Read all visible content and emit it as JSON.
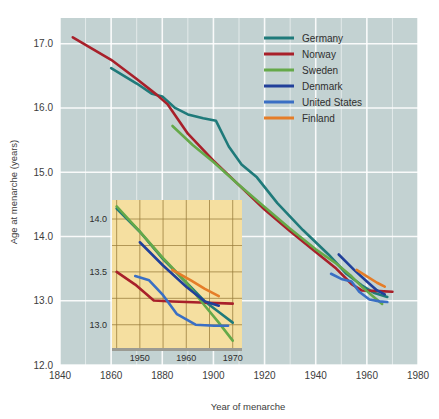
{
  "chart_data": {
    "type": "line",
    "title": "",
    "xlabel": "Year of menarche",
    "ylabel": "Age at menarche (years)",
    "xlim": [
      1840,
      1980
    ],
    "ylim": [
      12.0,
      17.4
    ],
    "xticks": [
      1840,
      1860,
      1880,
      1900,
      1920,
      1940,
      1960,
      1980
    ],
    "yticks": [
      12.0,
      13.0,
      14.0,
      15.0,
      16.0,
      17.0
    ],
    "xtick_labels": [
      "1840",
      "1860",
      "1880",
      "1900",
      "1920",
      "1940",
      "1960",
      "1980"
    ],
    "ytick_labels": [
      "12.0",
      "13.0",
      "14.0",
      "15.0",
      "16.0",
      "17.0"
    ],
    "grid": true,
    "legend_position": "top-right",
    "plot_background": "#c3d2d2",
    "grid_color": "#ffffff",
    "series": [
      {
        "name": "Germany",
        "color": "#1f7a7a",
        "points": [
          [
            1860,
            16.62
          ],
          [
            1870,
            16.38
          ],
          [
            1876,
            16.22
          ],
          [
            1880,
            16.18
          ],
          [
            1885,
            16.0
          ],
          [
            1890,
            15.9
          ],
          [
            1896,
            15.84
          ],
          [
            1901,
            15.8
          ],
          [
            1906,
            15.4
          ],
          [
            1911,
            15.12
          ],
          [
            1917,
            14.92
          ],
          [
            1925,
            14.52
          ],
          [
            1935,
            14.1
          ],
          [
            1945,
            13.72
          ],
          [
            1952,
            13.42
          ],
          [
            1958,
            13.24
          ],
          [
            1963,
            13.12
          ],
          [
            1968,
            13.06
          ]
        ]
      },
      {
        "name": "Norway",
        "color": "#a8202a",
        "points": [
          [
            1845,
            17.1
          ],
          [
            1860,
            16.75
          ],
          [
            1870,
            16.45
          ],
          [
            1878,
            16.2
          ],
          [
            1882,
            16.06
          ],
          [
            1890,
            15.6
          ],
          [
            1900,
            15.18
          ],
          [
            1910,
            14.8
          ],
          [
            1920,
            14.42
          ],
          [
            1930,
            14.08
          ],
          [
            1940,
            13.76
          ],
          [
            1948,
            13.5
          ],
          [
            1954,
            13.26
          ],
          [
            1958,
            13.16
          ],
          [
            1965,
            13.15
          ],
          [
            1970,
            13.14
          ]
        ]
      },
      {
        "name": "Sweden",
        "color": "#65a949",
        "points": [
          [
            1884,
            15.72
          ],
          [
            1892,
            15.42
          ],
          [
            1900,
            15.16
          ],
          [
            1910,
            14.8
          ],
          [
            1920,
            14.46
          ],
          [
            1930,
            14.12
          ],
          [
            1940,
            13.8
          ],
          [
            1948,
            13.58
          ],
          [
            1954,
            13.38
          ],
          [
            1958,
            13.22
          ],
          [
            1962,
            13.08
          ],
          [
            1966,
            12.95
          ]
        ]
      },
      {
        "name": "Denmark",
        "color": "#21409a",
        "points": [
          [
            1949,
            13.72
          ],
          [
            1955,
            13.48
          ],
          [
            1960,
            13.3
          ],
          [
            1964,
            13.16
          ],
          [
            1967,
            13.1
          ]
        ]
      },
      {
        "name": "United States",
        "color": "#3a6fc4",
        "points": [
          [
            1946,
            13.42
          ],
          [
            1950,
            13.34
          ],
          [
            1954,
            13.3
          ],
          [
            1957,
            13.14
          ],
          [
            1961,
            13.02
          ],
          [
            1965,
            12.99
          ],
          [
            1968,
            12.98
          ]
        ]
      },
      {
        "name": "Finland",
        "color": "#e57d28",
        "points": [
          [
            1956,
            13.48
          ],
          [
            1960,
            13.38
          ],
          [
            1964,
            13.28
          ],
          [
            1967,
            13.22
          ]
        ]
      }
    ]
  },
  "inset": {
    "type": "line",
    "xlim": [
      1944,
      1972
    ],
    "ylim": [
      12.78,
      14.18
    ],
    "xticks": [
      1950,
      1960,
      1970
    ],
    "yticks": [
      13.0,
      13.5,
      14.0
    ],
    "xtick_labels": [
      "1950",
      "1960",
      "1970"
    ],
    "ytick_labels": [
      "13.0",
      "13.5",
      "14.0"
    ],
    "background": "#f5dfa0",
    "grid_color": "#9a7d3c",
    "grid": true,
    "series": [
      {
        "name": "Germany",
        "color": "#1f7a7a",
        "points": [
          [
            1945,
            14.1
          ],
          [
            1950,
            13.88
          ],
          [
            1955,
            13.62
          ],
          [
            1960,
            13.4
          ],
          [
            1964,
            13.22
          ],
          [
            1967,
            13.12
          ],
          [
            1970,
            13.02
          ]
        ]
      },
      {
        "name": "Norway",
        "color": "#a8202a",
        "points": [
          [
            1945,
            13.5
          ],
          [
            1949,
            13.38
          ],
          [
            1953,
            13.23
          ],
          [
            1957,
            13.22
          ],
          [
            1963,
            13.21
          ],
          [
            1970,
            13.2
          ]
        ]
      },
      {
        "name": "Sweden",
        "color": "#65a949",
        "points": [
          [
            1945,
            14.12
          ],
          [
            1950,
            13.88
          ],
          [
            1955,
            13.63
          ],
          [
            1960,
            13.4
          ],
          [
            1964,
            13.18
          ],
          [
            1967,
            13.02
          ],
          [
            1970,
            12.85
          ]
        ]
      },
      {
        "name": "Denmark",
        "color": "#21409a",
        "points": [
          [
            1950,
            13.78
          ],
          [
            1955,
            13.56
          ],
          [
            1960,
            13.36
          ],
          [
            1964,
            13.22
          ],
          [
            1967,
            13.18
          ]
        ]
      },
      {
        "name": "United States",
        "color": "#3a6fc4",
        "points": [
          [
            1949,
            13.46
          ],
          [
            1952,
            13.42
          ],
          [
            1955,
            13.28
          ],
          [
            1958,
            13.1
          ],
          [
            1962,
            13.0
          ],
          [
            1966,
            12.99
          ],
          [
            1969,
            12.99
          ]
        ]
      },
      {
        "name": "Finland",
        "color": "#e57d28",
        "points": [
          [
            1957,
            13.52
          ],
          [
            1961,
            13.42
          ],
          [
            1964,
            13.34
          ],
          [
            1967,
            13.27
          ]
        ]
      }
    ]
  },
  "legend": {
    "items": [
      {
        "label": "Germany",
        "color": "#1f7a7a"
      },
      {
        "label": "Norway",
        "color": "#a8202a"
      },
      {
        "label": "Sweden",
        "color": "#65a949"
      },
      {
        "label": "Denmark",
        "color": "#21409a"
      },
      {
        "label": "United States",
        "color": "#3a6fc4"
      },
      {
        "label": "Finland",
        "color": "#e57d28"
      }
    ]
  }
}
